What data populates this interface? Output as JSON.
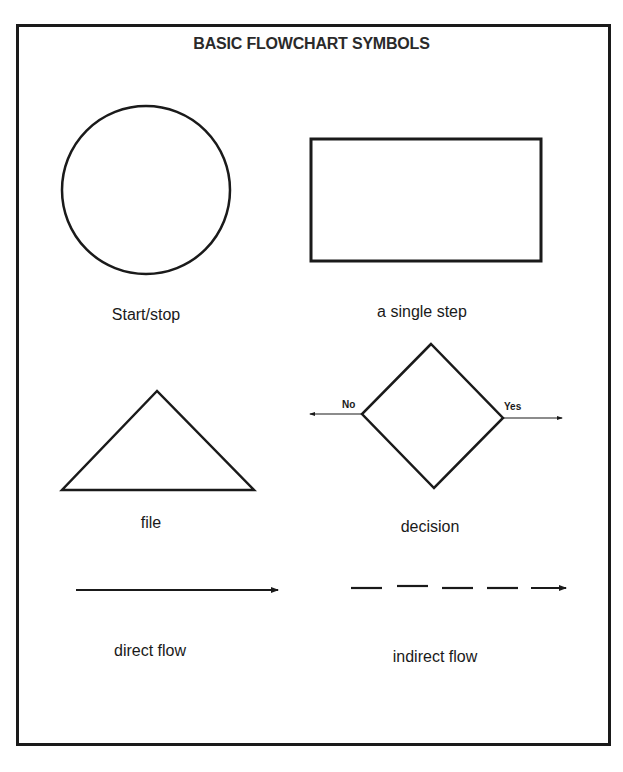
{
  "title": "BASIC FLOWCHART SYMBOLS",
  "symbols": [
    {
      "shape": "circle",
      "label": "Start/stop"
    },
    {
      "shape": "rectangle",
      "label": "a single step"
    },
    {
      "shape": "triangle",
      "label": "file"
    },
    {
      "shape": "diamond",
      "label": "decision",
      "branches": {
        "left": "No",
        "right": "Yes"
      }
    },
    {
      "shape": "solid-arrow",
      "label": "direct flow"
    },
    {
      "shape": "dashed-arrow",
      "label": "indirect flow"
    }
  ],
  "colors": {
    "stroke": "#1a1a1a",
    "background": "#ffffff"
  }
}
